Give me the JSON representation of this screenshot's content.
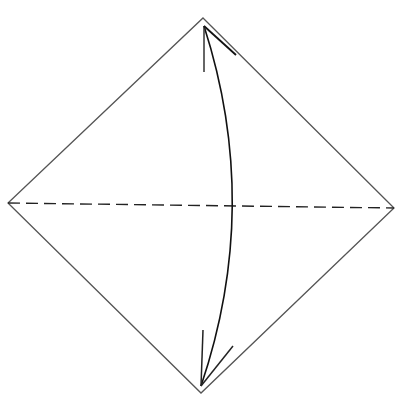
{
  "diagram": {
    "type": "origami-fold-step",
    "colors": {
      "background": "#ffffff",
      "paper_edge": "#555555",
      "fold_line": "#222222",
      "arrow": "#111111"
    },
    "shapes": {
      "diamond": {
        "top": [
          203,
          18
        ],
        "right": [
          394,
          208
        ],
        "bottom": [
          201,
          393
        ],
        "left": [
          8,
          203
        ]
      },
      "fold_line": {
        "from": [
          8,
          203
        ],
        "to": [
          394,
          208
        ],
        "style": "dashed"
      },
      "arrow": {
        "start": [
          204,
          26
        ],
        "end": [
          201,
          386
        ],
        "control": [
          262,
          206
        ],
        "heads": "both"
      }
    }
  }
}
